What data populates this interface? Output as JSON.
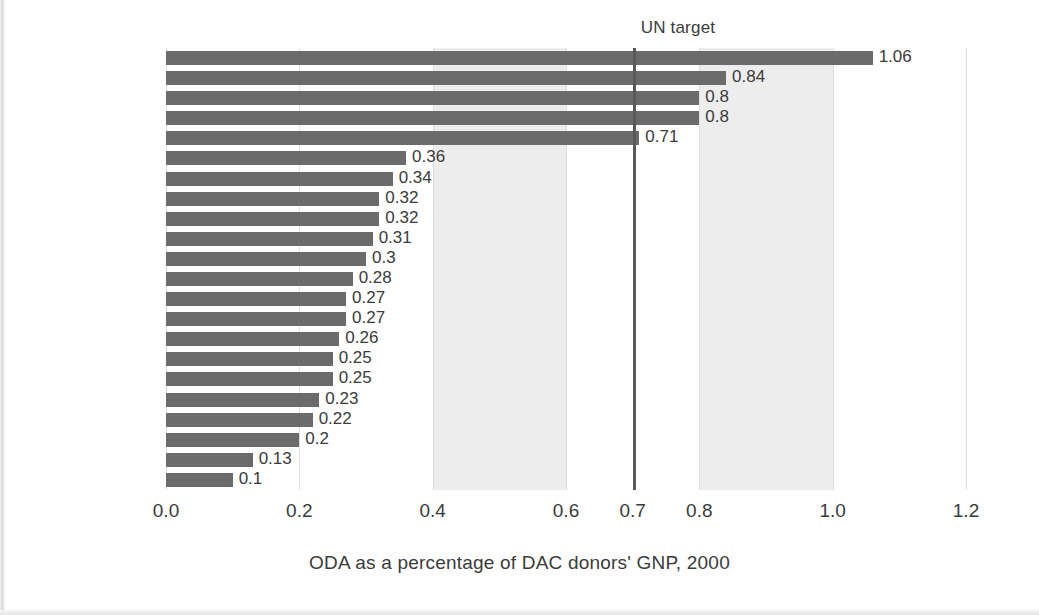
{
  "chart_data": {
    "type": "bar",
    "orientation": "horizontal",
    "title": "",
    "xlabel": "ODA as a percentage of DAC donors' GNP, 2000",
    "ylabel": "",
    "xlim": [
      0.0,
      1.2
    ],
    "xticks": [
      "0.0",
      "0.2",
      "0.4",
      "0.6",
      "0.7",
      "0.8",
      "1.0",
      "1.2"
    ],
    "xtick_values": [
      0.0,
      0.2,
      0.4,
      0.6,
      0.7,
      0.8,
      1.0,
      1.2
    ],
    "grid": true,
    "legend": "none",
    "bar_color": "#6b6b6b",
    "band_color": "#ededed",
    "shaded_bands": [
      [
        0.4,
        0.6
      ],
      [
        0.8,
        1.0
      ]
    ],
    "categories": [
      "Denmark",
      "Netherlands",
      "Norway",
      "Sweden",
      "Luxembourg",
      "Belgium",
      "Switzerland",
      "France",
      "United Kingdom",
      "Finland",
      "Ireland",
      "Japan",
      "Germany",
      "Australia",
      "Portugal",
      "New Zealand",
      "Canada",
      "Austria",
      "Spain",
      "Greece",
      "Italy",
      "United States"
    ],
    "values": [
      1.06,
      0.84,
      0.8,
      0.8,
      0.71,
      0.36,
      0.34,
      0.32,
      0.32,
      0.31,
      0.3,
      0.28,
      0.27,
      0.27,
      0.26,
      0.25,
      0.25,
      0.23,
      0.22,
      0.2,
      0.13,
      0.1
    ],
    "value_labels": [
      "1.06",
      "0.84",
      "0.8",
      "0.8",
      "0.71",
      "0.36",
      "0.34",
      "0.32",
      "0.32",
      "0.31",
      "0.3",
      "0.28",
      "0.27",
      "0.27",
      "0.26",
      "0.25",
      "0.25",
      "0.23",
      "0.22",
      "0.2",
      "0.13",
      "0.1"
    ],
    "annotations": [
      {
        "name": "un-target",
        "label": "UN target",
        "value": 0.7,
        "line_color": "#5a5a5a"
      }
    ]
  }
}
